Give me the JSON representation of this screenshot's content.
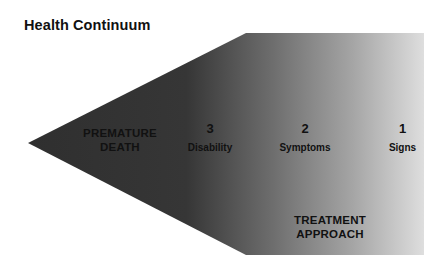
{
  "title": "Health Continuum",
  "diagram": {
    "shape": "left-pointing arrow pentagon",
    "gradient": {
      "left_color": "#2f2f2f",
      "mid_color": "#707070",
      "right_color": "#dcdcdc"
    },
    "end_label": {
      "line1": "PREMATURE",
      "line2": "DEATH"
    },
    "stages": [
      {
        "number": "3",
        "label": "Disability"
      },
      {
        "number": "2",
        "label": "Symptoms"
      },
      {
        "number": "1",
        "label": "Signs"
      }
    ],
    "approach_label": {
      "line1": "TREATMENT",
      "line2": "APPROACH"
    }
  }
}
